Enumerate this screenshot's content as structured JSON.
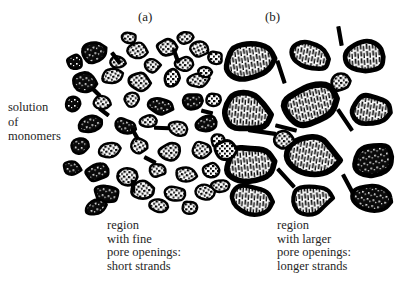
{
  "figure": {
    "panel_labels": [
      {
        "name": "a",
        "text": "(a)"
      },
      {
        "name": "b",
        "text": "(b)"
      }
    ],
    "side_label": {
      "lines": [
        "solution",
        "of",
        "monomers"
      ]
    },
    "captions": {
      "left": {
        "lines": [
          "region",
          "with fine",
          "pore openings:",
          "short strands"
        ]
      },
      "right": {
        "lines": [
          "region",
          "with larger",
          "pore openings:",
          "longer strands"
        ]
      }
    },
    "colors": {
      "background": "#ffffff",
      "ink": "#000000",
      "text": "#262626"
    }
  },
  "chart_data": {
    "type": "diagram",
    "regions": [
      {
        "id": "a",
        "label": "(a)",
        "caption": "region with fine pore openings: short strands",
        "particle_count": 48,
        "particle_size_px": [
          11,
          24
        ],
        "particle_fill": "dark-mottled",
        "strand_count": 9,
        "strand_length_px": [
          10,
          16
        ]
      },
      {
        "id": "b",
        "label": "(b)",
        "caption": "region with larger pore openings: longer strands",
        "particle_count": 15,
        "particle_size_px": [
          28,
          52
        ],
        "particle_fill": "striated-light",
        "strand_count": 7,
        "strand_length_px": [
          20,
          30
        ]
      }
    ],
    "particles_a": [
      {
        "cx": 93,
        "cy": 52,
        "rx": 13,
        "ry": 10,
        "rot": -18,
        "fill": "dark"
      },
      {
        "cx": 137,
        "cy": 50,
        "rx": 11,
        "ry": 8,
        "rot": 12,
        "fill": "light"
      },
      {
        "cx": 167,
        "cy": 48,
        "rx": 10,
        "ry": 9,
        "rot": -5,
        "fill": "light"
      },
      {
        "cx": 198,
        "cy": 49,
        "rx": 10,
        "ry": 8,
        "rot": 20,
        "fill": "light"
      },
      {
        "cx": 84,
        "cy": 82,
        "rx": 12,
        "ry": 10,
        "rot": 8,
        "fill": "dark"
      },
      {
        "cx": 112,
        "cy": 76,
        "rx": 10,
        "ry": 8,
        "rot": -14,
        "fill": "light"
      },
      {
        "cx": 140,
        "cy": 82,
        "rx": 11,
        "ry": 9,
        "rot": 6,
        "fill": "light"
      },
      {
        "cx": 172,
        "cy": 78,
        "rx": 9,
        "ry": 9,
        "rot": 0,
        "fill": "light"
      },
      {
        "cx": 199,
        "cy": 80,
        "rx": 11,
        "ry": 8,
        "rot": -10,
        "fill": "light"
      },
      {
        "cx": 205,
        "cy": 72,
        "rx": 7,
        "ry": 6,
        "rot": 0,
        "fill": "light"
      },
      {
        "cx": 102,
        "cy": 103,
        "rx": 9,
        "ry": 7,
        "rot": 10,
        "fill": "light"
      },
      {
        "cx": 132,
        "cy": 100,
        "rx": 8,
        "ry": 7,
        "rot": -8,
        "fill": "light"
      },
      {
        "cx": 160,
        "cy": 106,
        "rx": 12,
        "ry": 9,
        "rot": 14,
        "fill": "dark"
      },
      {
        "cx": 192,
        "cy": 102,
        "rx": 11,
        "ry": 9,
        "rot": -6,
        "fill": "dark"
      },
      {
        "cx": 213,
        "cy": 100,
        "rx": 8,
        "ry": 7,
        "rot": 0,
        "fill": "light"
      },
      {
        "cx": 90,
        "cy": 124,
        "rx": 13,
        "ry": 9,
        "rot": -20,
        "fill": "dark"
      },
      {
        "cx": 124,
        "cy": 126,
        "rx": 11,
        "ry": 8,
        "rot": 16,
        "fill": "dark"
      },
      {
        "cx": 149,
        "cy": 121,
        "rx": 9,
        "ry": 7,
        "rot": -4,
        "fill": "light"
      },
      {
        "cx": 178,
        "cy": 128,
        "rx": 10,
        "ry": 8,
        "rot": 8,
        "fill": "light"
      },
      {
        "cx": 206,
        "cy": 124,
        "rx": 12,
        "ry": 9,
        "rot": -12,
        "fill": "dark"
      },
      {
        "cx": 80,
        "cy": 146,
        "rx": 10,
        "ry": 8,
        "rot": 5,
        "fill": "dark"
      },
      {
        "cx": 110,
        "cy": 150,
        "rx": 11,
        "ry": 8,
        "rot": -10,
        "fill": "light"
      },
      {
        "cx": 139,
        "cy": 146,
        "rx": 9,
        "ry": 8,
        "rot": 14,
        "fill": "light"
      },
      {
        "cx": 170,
        "cy": 152,
        "rx": 12,
        "ry": 9,
        "rot": -6,
        "fill": "light"
      },
      {
        "cx": 201,
        "cy": 150,
        "rx": 10,
        "ry": 8,
        "rot": 9,
        "fill": "light"
      },
      {
        "cx": 97,
        "cy": 172,
        "rx": 12,
        "ry": 9,
        "rot": -14,
        "fill": "dark"
      },
      {
        "cx": 128,
        "cy": 176,
        "rx": 10,
        "ry": 9,
        "rot": 6,
        "fill": "light"
      },
      {
        "cx": 158,
        "cy": 170,
        "rx": 9,
        "ry": 7,
        "rot": -8,
        "fill": "light"
      },
      {
        "cx": 186,
        "cy": 174,
        "rx": 11,
        "ry": 8,
        "rot": 12,
        "fill": "light"
      },
      {
        "cx": 212,
        "cy": 170,
        "rx": 9,
        "ry": 7,
        "rot": 0,
        "fill": "light"
      },
      {
        "cx": 107,
        "cy": 194,
        "rx": 13,
        "ry": 9,
        "rot": 10,
        "fill": "dark"
      },
      {
        "cx": 143,
        "cy": 190,
        "rx": 11,
        "ry": 9,
        "rot": -9,
        "fill": "light"
      },
      {
        "cx": 175,
        "cy": 194,
        "rx": 11,
        "ry": 8,
        "rot": 7,
        "fill": "light"
      },
      {
        "cx": 205,
        "cy": 192,
        "rx": 10,
        "ry": 8,
        "rot": -12,
        "fill": "light"
      },
      {
        "cx": 75,
        "cy": 62,
        "rx": 8,
        "ry": 7,
        "rot": 0,
        "fill": "dark"
      },
      {
        "cx": 118,
        "cy": 62,
        "rx": 8,
        "ry": 6,
        "rot": 10,
        "fill": "light"
      },
      {
        "cx": 152,
        "cy": 66,
        "rx": 8,
        "ry": 7,
        "rot": -6,
        "fill": "light"
      },
      {
        "cx": 184,
        "cy": 64,
        "rx": 9,
        "ry": 7,
        "rot": 4,
        "fill": "light"
      },
      {
        "cx": 215,
        "cy": 58,
        "rx": 8,
        "ry": 7,
        "rot": 0,
        "fill": "light"
      },
      {
        "cx": 95,
        "cy": 208,
        "rx": 11,
        "ry": 8,
        "rot": -16,
        "fill": "dark"
      },
      {
        "cx": 160,
        "cy": 206,
        "rx": 10,
        "ry": 7,
        "rot": 8,
        "fill": "light"
      },
      {
        "cx": 190,
        "cy": 208,
        "rx": 9,
        "ry": 7,
        "rot": -5,
        "fill": "light"
      },
      {
        "cx": 73,
        "cy": 104,
        "rx": 8,
        "ry": 7,
        "rot": 0,
        "fill": "dark"
      },
      {
        "cx": 72,
        "cy": 168,
        "rx": 9,
        "ry": 7,
        "rot": 12,
        "fill": "dark"
      },
      {
        "cx": 218,
        "cy": 140,
        "rx": 8,
        "ry": 7,
        "rot": 0,
        "fill": "light"
      },
      {
        "cx": 220,
        "cy": 186,
        "rx": 9,
        "ry": 7,
        "rot": -8,
        "fill": "light"
      },
      {
        "cx": 129,
        "cy": 38,
        "rx": 8,
        "ry": 6,
        "rot": 6,
        "fill": "light"
      },
      {
        "cx": 186,
        "cy": 38,
        "rx": 8,
        "ry": 6,
        "rot": -6,
        "fill": "light"
      }
    ],
    "strands_a": [
      {
        "x": 116,
        "y": 58,
        "len": 14,
        "rot": 52
      },
      {
        "x": 176,
        "y": 56,
        "len": 15,
        "rot": 70
      },
      {
        "x": 104,
        "y": 112,
        "len": 12,
        "rot": 38
      },
      {
        "x": 135,
        "y": 134,
        "len": 13,
        "rot": 60
      },
      {
        "x": 162,
        "y": 128,
        "len": 16,
        "rot": 2
      },
      {
        "x": 150,
        "y": 160,
        "len": 13,
        "rot": 28
      },
      {
        "x": 133,
        "y": 186,
        "len": 12,
        "rot": 88
      },
      {
        "x": 96,
        "y": 92,
        "len": 11,
        "rot": 45
      },
      {
        "x": 207,
        "y": 112,
        "len": 12,
        "rot": 15
      }
    ],
    "particles_b": [
      {
        "cx": 250,
        "cy": 62,
        "rx": 26,
        "ry": 18,
        "rot": -8,
        "fill": "striated"
      },
      {
        "cx": 311,
        "cy": 56,
        "rx": 21,
        "ry": 15,
        "rot": 10,
        "fill": "striated"
      },
      {
        "cx": 366,
        "cy": 58,
        "rx": 20,
        "ry": 16,
        "rot": -4,
        "fill": "striated"
      },
      {
        "cx": 246,
        "cy": 112,
        "rx": 25,
        "ry": 19,
        "rot": 6,
        "fill": "striated"
      },
      {
        "cx": 311,
        "cy": 104,
        "rx": 26,
        "ry": 21,
        "rot": -12,
        "fill": "striated"
      },
      {
        "cx": 372,
        "cy": 110,
        "rx": 21,
        "ry": 16,
        "rot": 8,
        "fill": "striated"
      },
      {
        "cx": 249,
        "cy": 164,
        "rx": 25,
        "ry": 19,
        "rot": -6,
        "fill": "striated"
      },
      {
        "cx": 313,
        "cy": 156,
        "rx": 25,
        "ry": 19,
        "rot": 9,
        "fill": "striated"
      },
      {
        "cx": 374,
        "cy": 160,
        "rx": 20,
        "ry": 16,
        "rot": -10,
        "fill": "dark"
      },
      {
        "cx": 250,
        "cy": 200,
        "rx": 21,
        "ry": 15,
        "rot": 5,
        "fill": "striated"
      },
      {
        "cx": 310,
        "cy": 200,
        "rx": 22,
        "ry": 14,
        "rot": -5,
        "fill": "striated"
      },
      {
        "cx": 372,
        "cy": 198,
        "rx": 19,
        "ry": 13,
        "rot": 12,
        "fill": "dark"
      },
      {
        "cx": 226,
        "cy": 150,
        "rx": 12,
        "ry": 10,
        "rot": 0,
        "fill": "light"
      },
      {
        "cx": 283,
        "cy": 140,
        "rx": 11,
        "ry": 9,
        "rot": 6,
        "fill": "light"
      },
      {
        "cx": 340,
        "cy": 82,
        "rx": 10,
        "ry": 9,
        "rot": -6,
        "fill": "light"
      }
    ],
    "strands_b": [
      {
        "x": 281,
        "y": 72,
        "len": 24,
        "rot": 72
      },
      {
        "x": 345,
        "y": 120,
        "len": 26,
        "rot": 56
      },
      {
        "x": 262,
        "y": 132,
        "len": 28,
        "rot": 8
      },
      {
        "x": 286,
        "y": 128,
        "len": 22,
        "rot": 14
      },
      {
        "x": 286,
        "y": 178,
        "len": 25,
        "rot": 48
      },
      {
        "x": 348,
        "y": 184,
        "len": 22,
        "rot": 62
      },
      {
        "x": 340,
        "y": 36,
        "len": 20,
        "rot": 80
      }
    ]
  }
}
